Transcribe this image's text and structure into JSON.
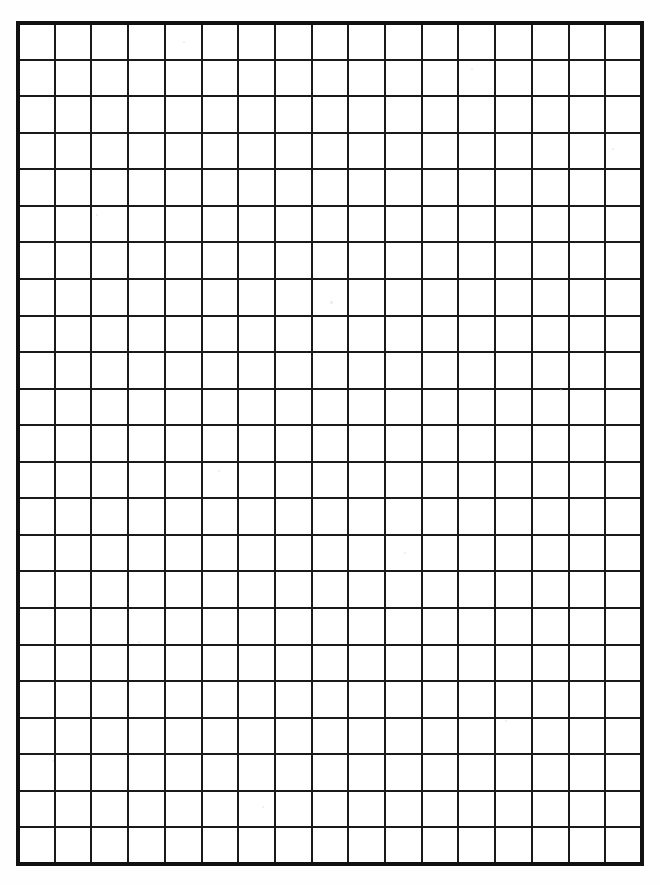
{
  "document": {
    "title": "Blank Grid Paper",
    "kind": "grid-paper-sheet",
    "caption": ""
  },
  "canvas": {
    "width": 660,
    "height": 885,
    "background_color": "#ffffff",
    "paper_color": "#fefefe"
  },
  "grid": {
    "origin_x": 18,
    "origin_y": 23,
    "width": 624,
    "height": 841,
    "columns": 17,
    "rows": 23,
    "cell_width": 36.7,
    "cell_height": 36.6,
    "line_color": "#1a1a1a",
    "inner_line_width": 2,
    "border_color": "#111111",
    "border_width": 4,
    "first_row_partial": false,
    "last_row_partial": false
  },
  "specks": [
    {
      "x": 183,
      "y": 41,
      "r": 1.2
    },
    {
      "x": 471,
      "y": 68,
      "r": 1.0
    },
    {
      "x": 96,
      "y": 214,
      "r": 1.1
    },
    {
      "x": 330,
      "y": 301,
      "r": 1.3
    },
    {
      "x": 560,
      "y": 389,
      "r": 1.0
    },
    {
      "x": 218,
      "y": 470,
      "r": 1.2
    },
    {
      "x": 404,
      "y": 552,
      "r": 1.0
    },
    {
      "x": 138,
      "y": 641,
      "r": 1.1
    },
    {
      "x": 505,
      "y": 720,
      "r": 1.2
    },
    {
      "x": 262,
      "y": 806,
      "r": 1.0
    },
    {
      "x": 612,
      "y": 148,
      "r": 0.9
    },
    {
      "x": 52,
      "y": 760,
      "r": 1.0
    }
  ]
}
